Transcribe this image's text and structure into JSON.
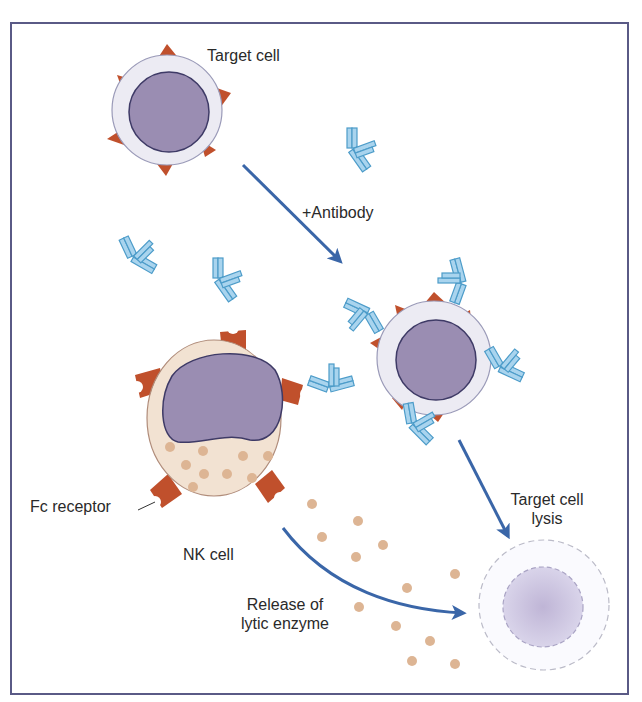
{
  "diagram": {
    "type": "biology-illustration",
    "labels": {
      "target_cell": "Target cell",
      "antibody": "+Antibody",
      "fc_receptor": "Fc receptor",
      "nk_cell": "NK cell",
      "release_line1": "Release of",
      "release_line2": "lytic enzyme",
      "lysis_line1": "Target cell",
      "lysis_line2": "lysis"
    },
    "colors": {
      "frame": "#5a5a86",
      "arrow": "#3a66a8",
      "antibody_fill": "#a9d4ee",
      "antibody_stroke": "#4d9cc9",
      "nucleus": "#9a8db2",
      "nucleus_stroke": "#3e3a66",
      "target_membrane": "#ecebf3",
      "antigen": "#c0502c",
      "nk_cytoplasm": "#f2e2d2",
      "granule": "#ddb594",
      "lysed_cell": "#c9c2dc"
    },
    "elements": [
      {
        "id": "target-cell",
        "kind": "cell",
        "center": [
          159,
          105
        ]
      },
      {
        "id": "coated-target-cell",
        "kind": "cell",
        "center": [
          434,
          360
        ]
      },
      {
        "id": "nk-cell",
        "kind": "cell",
        "center": [
          210,
          415
        ]
      },
      {
        "id": "lysed-cell",
        "kind": "cell-remnant",
        "center": [
          546,
          608
        ]
      },
      {
        "id": "arrow-add-antibody",
        "kind": "arrow",
        "from": [
          243,
          165
        ],
        "to": [
          342,
          263
        ]
      },
      {
        "id": "arrow-lysis",
        "kind": "arrow",
        "from": [
          459,
          440
        ],
        "to": [
          510,
          540
        ]
      },
      {
        "id": "arrow-release",
        "kind": "curved-arrow",
        "from": [
          283,
          528
        ],
        "to": [
          465,
          613
        ]
      }
    ],
    "granules": [
      [
        312,
        504
      ],
      [
        358,
        521
      ],
      [
        322,
        537
      ],
      [
        383,
        545
      ],
      [
        356,
        557
      ],
      [
        455,
        574
      ],
      [
        407,
        588
      ],
      [
        359,
        607
      ],
      [
        396,
        626
      ],
      [
        430,
        641
      ],
      [
        412,
        661
      ],
      [
        455,
        664
      ]
    ]
  }
}
